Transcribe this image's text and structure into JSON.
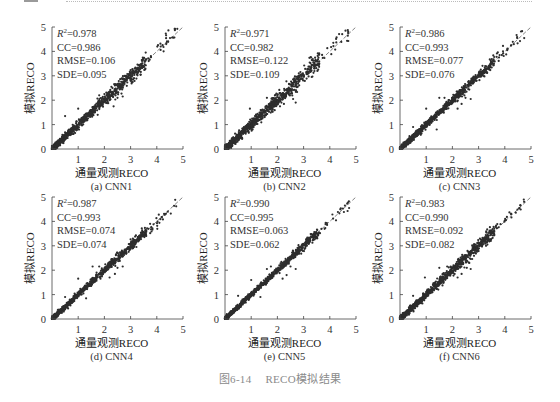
{
  "figure": {
    "caption_number": "图6-14",
    "caption_text": "RECO模拟结果"
  },
  "chart_data": [
    {
      "type": "scatter",
      "panel": "(a) CNN1",
      "xlabel": "通量观测RECO",
      "ylabel": "模拟RECO",
      "xlim": [
        0,
        5
      ],
      "ylim": [
        0,
        5
      ],
      "xticks": [
        "1",
        "2",
        "3",
        "4",
        "5"
      ],
      "yticks": [
        "0",
        "1",
        "2",
        "3",
        "4",
        "5"
      ],
      "reference_line": "1:1 dashed",
      "stats": [
        {
          "label": "R²",
          "value": "0.978"
        },
        {
          "label": "CC",
          "value": "0.986"
        },
        {
          "label": "RMSE",
          "value": "0.106"
        },
        {
          "label": "SDE",
          "value": "0.095"
        }
      ],
      "spread": 0.106,
      "outliers": [
        [
          0.5,
          1.35
        ],
        [
          1.0,
          1.65
        ],
        [
          2.0,
          2.25
        ],
        [
          2.2,
          2.0
        ],
        [
          2.35,
          1.75
        ],
        [
          2.5,
          2.1
        ],
        [
          2.7,
          2.15
        ],
        [
          1.8,
          2.2
        ]
      ]
    },
    {
      "type": "scatter",
      "panel": "(b) CNN2",
      "xlabel": "通量观测RECO",
      "ylabel": "模拟RECO",
      "xlim": [
        0,
        5
      ],
      "ylim": [
        0,
        5
      ],
      "xticks": [
        "1",
        "2",
        "3",
        "4",
        "5"
      ],
      "yticks": [
        "0",
        "1",
        "2",
        "3",
        "4",
        "5"
      ],
      "reference_line": "1:1 dashed",
      "stats": [
        {
          "label": "R²",
          "value": "0.971"
        },
        {
          "label": "CC",
          "value": "0.982"
        },
        {
          "label": "RMSE",
          "value": "0.122"
        },
        {
          "label": "SDE",
          "value": "0.109"
        }
      ],
      "spread": 0.122,
      "outliers": [
        [
          0.95,
          1.65
        ],
        [
          1.6,
          2.1
        ],
        [
          2.0,
          2.2
        ],
        [
          2.1,
          1.75
        ],
        [
          2.25,
          1.85
        ],
        [
          2.6,
          2.05
        ],
        [
          2.7,
          1.9
        ],
        [
          4.6,
          4.85
        ],
        [
          4.7,
          4.75
        ]
      ]
    },
    {
      "type": "scatter",
      "panel": "(c) CNN3",
      "xlabel": "通量观测RECO",
      "ylabel": "模拟RECO",
      "xlim": [
        0,
        5
      ],
      "ylim": [
        0,
        5
      ],
      "xticks": [
        "1",
        "2",
        "3",
        "4",
        "5"
      ],
      "yticks": [
        "0",
        "1",
        "2",
        "3",
        "4",
        "5"
      ],
      "reference_line": "1:1 dashed",
      "stats": [
        {
          "label": "R²",
          "value": "0.986"
        },
        {
          "label": "CC",
          "value": "0.993"
        },
        {
          "label": "RMSE",
          "value": "0.077"
        },
        {
          "label": "SDE",
          "value": "0.076"
        }
      ],
      "spread": 0.077,
      "outliers": [
        [
          0.5,
          0.9
        ],
        [
          1.0,
          1.65
        ],
        [
          1.5,
          2.1
        ],
        [
          1.7,
          2.1
        ],
        [
          2.2,
          1.65
        ],
        [
          2.35,
          1.85
        ],
        [
          2.5,
          2.1
        ],
        [
          2.7,
          2.05
        ],
        [
          1.4,
          0.8
        ]
      ]
    },
    {
      "type": "scatter",
      "panel": "(d) CNN4",
      "xlabel": "通量观测RECO",
      "ylabel": "模拟RECO",
      "xlim": [
        0,
        5
      ],
      "ylim": [
        0,
        5
      ],
      "xticks": [
        "1",
        "2",
        "3",
        "4",
        "5"
      ],
      "yticks": [
        "0",
        "1",
        "2",
        "3",
        "4",
        "5"
      ],
      "reference_line": "1:1 dashed",
      "stats": [
        {
          "label": "R²",
          "value": "0.987"
        },
        {
          "label": "CC",
          "value": "0.993"
        },
        {
          "label": "RMSE",
          "value": "0.074"
        },
        {
          "label": "SDE",
          "value": "0.074"
        }
      ],
      "spread": 0.074,
      "outliers": [
        [
          0.5,
          0.9
        ],
        [
          1.0,
          1.65
        ],
        [
          1.55,
          2.15
        ],
        [
          1.8,
          2.15
        ],
        [
          2.2,
          1.7
        ],
        [
          2.4,
          1.85
        ],
        [
          2.5,
          2.1
        ],
        [
          2.7,
          2.15
        ],
        [
          1.3,
          0.85
        ]
      ]
    },
    {
      "type": "scatter",
      "panel": "(e) CNN5",
      "xlabel": "通量观测RECO",
      "ylabel": "模拟RECO",
      "xlim": [
        0,
        5
      ],
      "ylim": [
        0,
        5
      ],
      "xticks": [
        "1",
        "2",
        "3",
        "4",
        "5"
      ],
      "yticks": [
        "0",
        "1",
        "2",
        "3",
        "4",
        "5"
      ],
      "reference_line": "1:1 dashed",
      "stats": [
        {
          "label": "R²",
          "value": "0.990"
        },
        {
          "label": "CC",
          "value": "0.995"
        },
        {
          "label": "RMSE",
          "value": "0.063"
        },
        {
          "label": "SDE",
          "value": "0.062"
        }
      ],
      "spread": 0.063,
      "outliers": [
        [
          0.5,
          0.95
        ],
        [
          1.0,
          1.6
        ],
        [
          1.6,
          2.05
        ],
        [
          1.75,
          2.15
        ],
        [
          2.2,
          1.65
        ],
        [
          2.35,
          1.8
        ],
        [
          2.5,
          2.15
        ],
        [
          2.7,
          2.05
        ],
        [
          1.35,
          0.9
        ]
      ]
    },
    {
      "type": "scatter",
      "panel": "(f) CNN6",
      "xlabel": "通量观测RECO",
      "ylabel": "模拟RECO",
      "xlim": [
        0,
        5
      ],
      "ylim": [
        0,
        5
      ],
      "xticks": [
        "1",
        "2",
        "3",
        "4",
        "5"
      ],
      "yticks": [
        "0",
        "1",
        "2",
        "3",
        "4",
        "5"
      ],
      "reference_line": "1:1 dashed",
      "stats": [
        {
          "label": "R²",
          "value": "0.983"
        },
        {
          "label": "CC",
          "value": "0.990"
        },
        {
          "label": "RMSE",
          "value": "0.092"
        },
        {
          "label": "SDE",
          "value": "0.082"
        }
      ],
      "spread": 0.092,
      "outliers": [
        [
          0.5,
          0.95
        ],
        [
          0.95,
          1.7
        ],
        [
          1.5,
          2.1
        ],
        [
          1.8,
          2.15
        ],
        [
          2.2,
          1.7
        ],
        [
          2.35,
          1.85
        ],
        [
          2.55,
          2.1
        ],
        [
          2.7,
          2.05
        ],
        [
          4.6,
          4.65
        ]
      ]
    }
  ]
}
